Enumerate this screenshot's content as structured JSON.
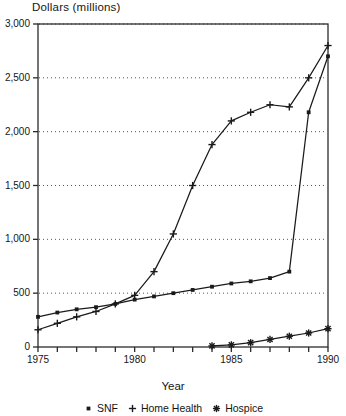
{
  "chart_data": {
    "type": "line",
    "title": "Dollars (millions)",
    "xlabel": "Year",
    "ylabel": "Dollars (millions)",
    "xlim": [
      1975,
      1990
    ],
    "ylim": [
      0,
      3000
    ],
    "grid": "horizontal-dotted",
    "legend_position": "bottom-center",
    "y_ticks": [
      0,
      500,
      1000,
      1500,
      2000,
      2500,
      3000
    ],
    "y_tick_labels": [
      "0",
      "500",
      "1,000",
      "1,500",
      "2,000",
      "2,500",
      "3,000"
    ],
    "x_ticks": [
      1975,
      1976,
      1977,
      1978,
      1979,
      1980,
      1981,
      1982,
      1983,
      1984,
      1985,
      1986,
      1987,
      1988,
      1989,
      1990
    ],
    "x_tick_labels": [
      {
        "value": 1975,
        "label": "1975"
      },
      {
        "value": 1980,
        "label": "1980"
      },
      {
        "value": 1985,
        "label": "1985"
      },
      {
        "value": 1990,
        "label": "1990"
      }
    ],
    "x": [
      1975,
      1976,
      1977,
      1978,
      1979,
      1980,
      1981,
      1982,
      1983,
      1984,
      1985,
      1986,
      1987,
      1988,
      1989,
      1990
    ],
    "series": [
      {
        "name": "SNF",
        "marker": "square",
        "x": [
          1975,
          1976,
          1977,
          1978,
          1979,
          1980,
          1981,
          1982,
          1983,
          1984,
          1985,
          1986,
          1987,
          1988,
          1989,
          1990
        ],
        "values": [
          280,
          320,
          350,
          370,
          400,
          440,
          470,
          500,
          530,
          560,
          590,
          610,
          640,
          700,
          2180,
          2700
        ]
      },
      {
        "name": "Home Health",
        "marker": "plus",
        "x": [
          1975,
          1976,
          1977,
          1978,
          1979,
          1980,
          1981,
          1982,
          1983,
          1984,
          1985,
          1986,
          1987,
          1988,
          1989,
          1990
        ],
        "values": [
          160,
          220,
          280,
          330,
          400,
          480,
          700,
          1050,
          1500,
          1880,
          2100,
          2180,
          2250,
          2230,
          2500,
          2800
        ]
      },
      {
        "name": "Hospice",
        "marker": "asterisk",
        "x": [
          1984,
          1985,
          1986,
          1987,
          1988,
          1989,
          1990
        ],
        "values": [
          10,
          20,
          40,
          70,
          100,
          130,
          170
        ]
      }
    ]
  },
  "legend": {
    "items": [
      {
        "label": "SNF",
        "glyph": "square-marker"
      },
      {
        "label": "Home Health",
        "glyph": "plus-marker"
      },
      {
        "label": "Hospice",
        "glyph": "asterisk-marker"
      }
    ]
  },
  "axis_titles": {
    "y": "Dollars (millions)",
    "x": "Year"
  },
  "colors": {
    "line": "#1a1a1a",
    "grid": "#555555",
    "frame": "#2b2b2b",
    "background": "#ffffff"
  }
}
